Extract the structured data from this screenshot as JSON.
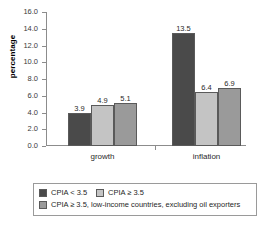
{
  "chart_data": {
    "type": "bar",
    "title": "",
    "xlabel": "",
    "ylabel": "percentage",
    "ylim": [
      0.0,
      16.0
    ],
    "ytick_step": 2.0,
    "ytick_labels": [
      "0.0",
      "2.0",
      "4.0",
      "6.0",
      "8.0",
      "10.0",
      "12.0",
      "14.0",
      "16.0"
    ],
    "ytick_values": [
      0.0,
      2.0,
      4.0,
      6.0,
      8.0,
      10.0,
      12.0,
      14.0,
      16.0
    ],
    "grid": false,
    "legend_position": "bottom",
    "categories": [
      "growth",
      "inflation"
    ],
    "series": [
      {
        "name": "CPIA < 3.5",
        "color": "#4a4a4a",
        "values": [
          3.9,
          13.5
        ],
        "labels": [
          "3.9",
          "13.5"
        ]
      },
      {
        "name": "CPIA ≥ 3.5",
        "color": "#c4c4c4",
        "values": [
          4.9,
          6.4
        ],
        "labels": [
          "4.9",
          "6.4"
        ]
      },
      {
        "name": "CPIA ≥ 3.5, low-income countries, excluding oil exporters",
        "color": "#9a9a9a",
        "values": [
          5.1,
          6.9
        ],
        "labels": [
          "5.1",
          "6.9"
        ]
      }
    ]
  },
  "axis": {
    "y_title": "percentage"
  },
  "legend": {
    "entries": [
      {
        "label": "CPIA < 3.5",
        "color": "#4a4a4a"
      },
      {
        "label": "CPIA ≥ 3.5",
        "color": "#c4c4c4"
      },
      {
        "label": "CPIA ≥ 3.5, low-income countries, excluding oil exporters",
        "color": "#9a9a9a"
      }
    ]
  }
}
